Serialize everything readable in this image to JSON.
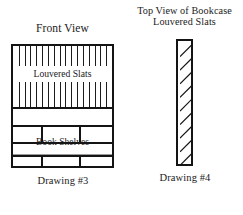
{
  "figure": {
    "front_view": {
      "title": "Front View",
      "caption": "Drawing #3",
      "louver_label": "Louvered Slats",
      "shelves_label": "Book Shelves",
      "slat_count": 16
    },
    "top_view": {
      "title_line1": "Top View of  Bookcase",
      "title_line2": "Louvered Slats",
      "caption": "Drawing #4",
      "hatch_count": 9
    },
    "colors": {
      "ink": "#141414",
      "paper": "#ffffff",
      "faint_rule": "#9a9a9a"
    }
  }
}
